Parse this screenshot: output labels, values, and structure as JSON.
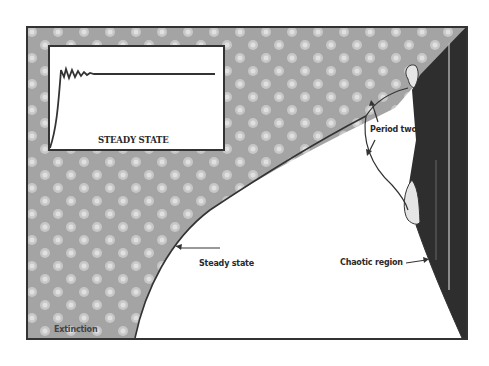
{
  "diagram": {
    "inset": {
      "title": "STEADY STATE",
      "description": "Time series rising from zero, damped oscillations, then settling to a constant level"
    },
    "regions": {
      "extinction": "Extinction",
      "steady_state": "Steady state",
      "period_two": "Period two",
      "chaotic": "Chaotic region"
    },
    "colors": {
      "background": "#ffffff",
      "extinction_fill": "#a8a8a8",
      "chaotic_fill": "#2e2e2e",
      "line": "#333333"
    }
  }
}
